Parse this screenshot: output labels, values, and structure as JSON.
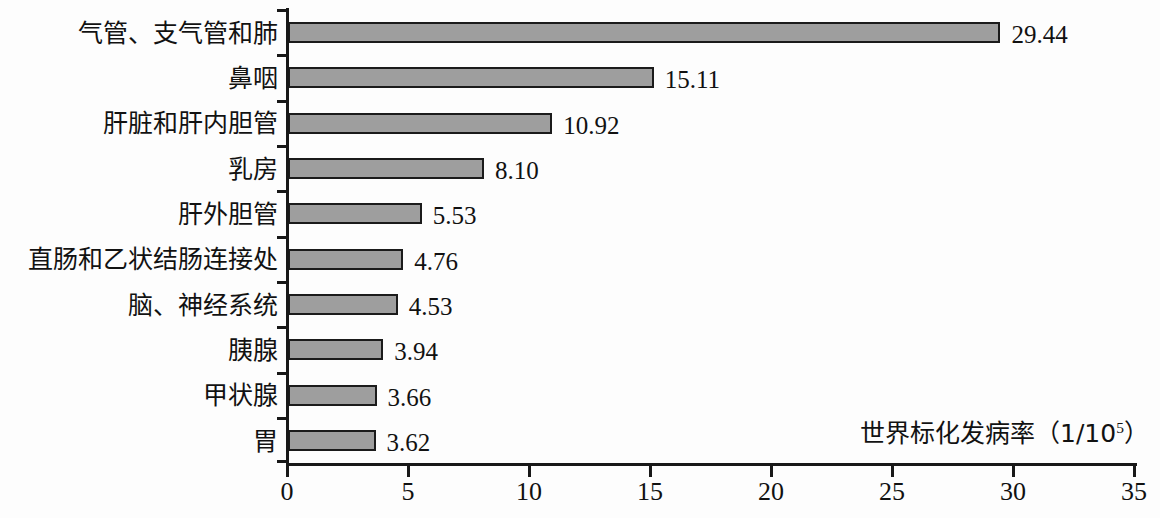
{
  "chart_data": {
    "type": "bar",
    "orientation": "horizontal",
    "title": "",
    "xlabel": "世界标化发病率（1/10⁵）",
    "ylabel": "",
    "xlim": [
      0,
      35
    ],
    "xticks": [
      0,
      5,
      10,
      15,
      20,
      25,
      30,
      35
    ],
    "xtick_labels": [
      "0",
      "5",
      "10",
      "15",
      "20",
      "25",
      "30",
      "35"
    ],
    "grid": false,
    "legend": false,
    "categories": [
      "气管、支气管和肺",
      "鼻咽",
      "肝脏和肝内胆管",
      "乳房",
      "肝外胆管",
      "直肠和乙状结肠连接处",
      "脑、神经系统",
      "胰腺",
      "甲状腺",
      "胃"
    ],
    "values": [
      29.44,
      15.11,
      10.92,
      8.1,
      5.53,
      4.76,
      4.53,
      3.94,
      3.66,
      3.62
    ],
    "value_labels": [
      "29.44",
      "15.11",
      "10.92",
      "8.10",
      "5.53",
      "4.76",
      "4.53",
      "3.94",
      "3.66",
      "3.62"
    ],
    "bar_color": "#9e9e9e",
    "bar_edge_color": "#1b1b1b",
    "background_color": "#fdfdfd"
  },
  "axis_title": {
    "text_prefix": "世界标化发病率（1/10",
    "exponent": "5",
    "text_suffix": "）"
  }
}
